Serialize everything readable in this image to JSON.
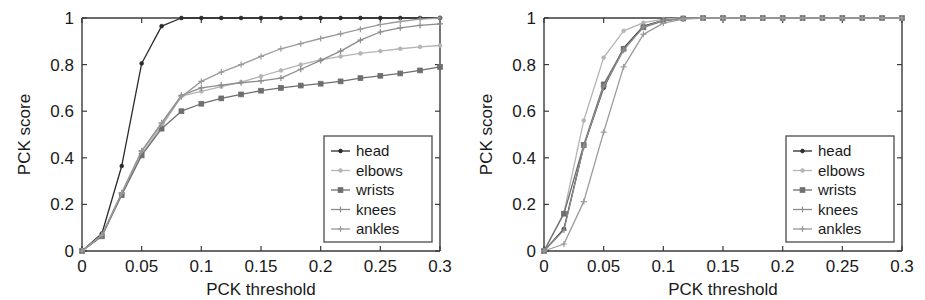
{
  "figure": {
    "background_color": "#ffffff",
    "axis_color": "#3a3a3a",
    "text_color": "#1a1a1a"
  },
  "panels": [
    {
      "id": "left-panel",
      "name": "pck-chart-left"
    },
    {
      "id": "right-panel",
      "name": "pck-chart-right"
    }
  ],
  "legend": {
    "entries": [
      {
        "label": "head",
        "color": "#2b2b2b",
        "marker": "dot"
      },
      {
        "label": "elbows",
        "color": "#b4b4b4",
        "marker": "dot"
      },
      {
        "label": "wrists",
        "color": "#6e6e6e",
        "marker": "square"
      },
      {
        "label": "knees",
        "color": "#8c8c8c",
        "marker": "plus"
      },
      {
        "label": "ankles",
        "color": "#9a9a9a",
        "marker": "plus"
      }
    ],
    "border_color": "#4a4a4a"
  },
  "axes": {
    "xlabel": "PCK threshold",
    "ylabel": "PCK score",
    "xticks": [
      "0",
      "0.05",
      "0.1",
      "0.15",
      "0.2",
      "0.25",
      "0.3"
    ],
    "yticks": [
      "0",
      "0.2",
      "0.4",
      "0.6",
      "0.8",
      "1"
    ],
    "xlim": [
      0,
      0.3
    ],
    "ylim": [
      0,
      1
    ]
  },
  "chart_data": [
    {
      "type": "line",
      "id": "left",
      "title": "",
      "xlabel": "PCK threshold",
      "ylabel": "PCK score",
      "xlim": [
        0,
        0.3
      ],
      "ylim": [
        0,
        1
      ],
      "grid": false,
      "legend_position": "lower-right",
      "x": [
        0,
        0.0167,
        0.0333,
        0.05,
        0.0667,
        0.0833,
        0.1,
        0.1167,
        0.1333,
        0.15,
        0.1667,
        0.1833,
        0.2,
        0.2167,
        0.2333,
        0.25,
        0.2667,
        0.2833,
        0.3
      ],
      "series": [
        {
          "name": "head",
          "color": "#2b2b2b",
          "values": [
            0.0,
            0.075,
            0.365,
            0.805,
            0.965,
            1.0,
            1.0,
            1.0,
            1.0,
            1.0,
            1.0,
            1.0,
            1.0,
            1.0,
            1.0,
            1.0,
            1.0,
            1.0,
            1.0
          ]
        },
        {
          "name": "elbows",
          "color": "#b4b4b4",
          "values": [
            0.0,
            0.065,
            0.245,
            0.415,
            0.535,
            0.665,
            0.685,
            0.705,
            0.725,
            0.75,
            0.775,
            0.8,
            0.82,
            0.835,
            0.848,
            0.858,
            0.868,
            0.876,
            0.882
          ]
        },
        {
          "name": "wrists",
          "color": "#6e6e6e",
          "values": [
            0.0,
            0.063,
            0.24,
            0.41,
            0.525,
            0.6,
            0.632,
            0.655,
            0.672,
            0.688,
            0.7,
            0.71,
            0.718,
            0.728,
            0.742,
            0.752,
            0.762,
            0.775,
            0.79
          ]
        },
        {
          "name": "knees",
          "color": "#8c8c8c",
          "values": [
            0.0,
            0.07,
            0.25,
            0.43,
            0.55,
            0.668,
            0.7,
            0.712,
            0.722,
            0.73,
            0.742,
            0.78,
            0.818,
            0.858,
            0.905,
            0.94,
            0.958,
            0.968,
            0.975
          ]
        },
        {
          "name": "ankles",
          "color": "#9a9a9a",
          "values": [
            0.0,
            0.068,
            0.248,
            0.428,
            0.545,
            0.662,
            0.728,
            0.768,
            0.8,
            0.835,
            0.868,
            0.89,
            0.912,
            0.932,
            0.952,
            0.972,
            0.985,
            0.995,
            1.0
          ]
        }
      ]
    },
    {
      "type": "line",
      "id": "right",
      "title": "",
      "xlabel": "PCK threshold",
      "ylabel": "PCK score",
      "xlim": [
        0,
        0.3
      ],
      "ylim": [
        0,
        1
      ],
      "grid": false,
      "legend_position": "lower-right",
      "x": [
        0,
        0.0167,
        0.0333,
        0.05,
        0.0667,
        0.0833,
        0.1,
        0.1167,
        0.1333,
        0.15,
        0.1667,
        0.1833,
        0.2,
        0.2167,
        0.2333,
        0.25,
        0.2667,
        0.2833,
        0.3
      ],
      "series": [
        {
          "name": "head",
          "color": "#2b2b2b",
          "values": [
            0.0,
            0.095,
            0.45,
            0.7,
            0.87,
            0.965,
            0.99,
            0.998,
            1.0,
            1.0,
            1.0,
            1.0,
            1.0,
            1.0,
            1.0,
            1.0,
            1.0,
            1.0,
            1.0
          ]
        },
        {
          "name": "elbows",
          "color": "#b4b4b4",
          "values": [
            0.0,
            0.165,
            0.56,
            0.83,
            0.945,
            0.98,
            0.995,
            1.0,
            1.0,
            1.0,
            1.0,
            1.0,
            1.0,
            1.0,
            1.0,
            1.0,
            1.0,
            1.0,
            1.0
          ]
        },
        {
          "name": "wrists",
          "color": "#6e6e6e",
          "values": [
            0.0,
            0.16,
            0.455,
            0.715,
            0.868,
            0.96,
            0.988,
            0.998,
            1.0,
            1.0,
            1.0,
            1.0,
            1.0,
            1.0,
            1.0,
            1.0,
            1.0,
            1.0,
            1.0
          ]
        },
        {
          "name": "knees",
          "color": "#8c8c8c",
          "values": [
            0.0,
            0.09,
            0.448,
            0.705,
            0.862,
            0.962,
            0.99,
            0.998,
            1.0,
            1.0,
            1.0,
            1.0,
            1.0,
            1.0,
            1.0,
            1.0,
            1.0,
            1.0,
            1.0
          ]
        },
        {
          "name": "ankles",
          "color": "#9a9a9a",
          "values": [
            0.0,
            0.03,
            0.212,
            0.51,
            0.79,
            0.93,
            0.978,
            0.995,
            1.0,
            1.0,
            1.0,
            1.0,
            1.0,
            1.0,
            1.0,
            1.0,
            1.0,
            1.0,
            1.0
          ]
        }
      ]
    }
  ]
}
